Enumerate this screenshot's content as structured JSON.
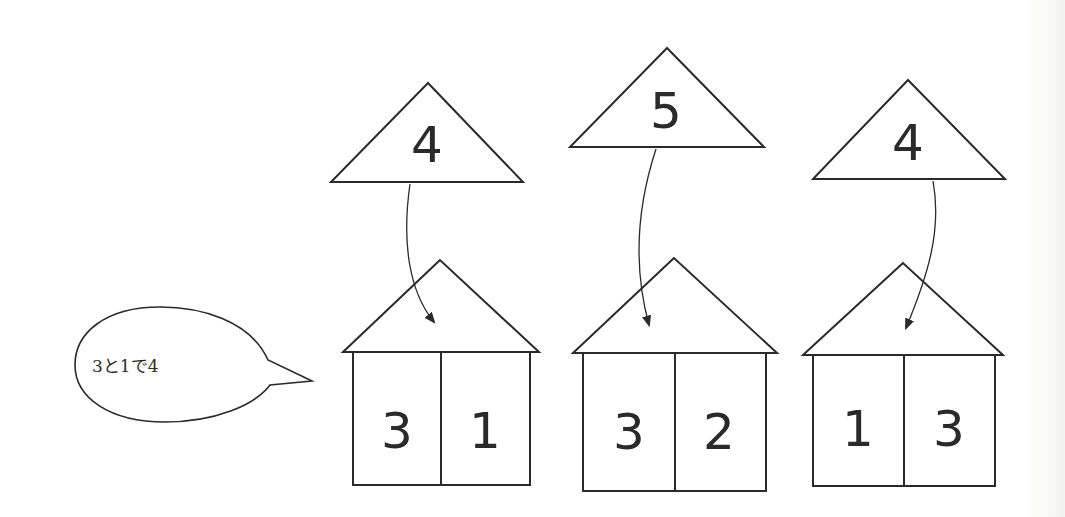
{
  "speech_bubble": {
    "text": "3と1で4"
  },
  "groups": [
    {
      "total": "4",
      "left": "3",
      "right": "1"
    },
    {
      "total": "5",
      "left": "3",
      "right": "2"
    },
    {
      "total": "4",
      "left": "1",
      "right": "3"
    }
  ],
  "colors": {
    "line": "#2a2a2a",
    "background": "#ffffff"
  }
}
